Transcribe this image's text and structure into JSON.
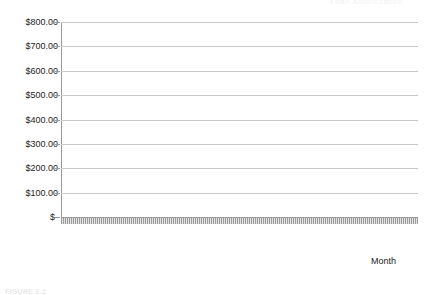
{
  "figure": {
    "cropped_title_fragment": "Loan Amortization",
    "cropped_caption_fragment": "FIGURE 2.2"
  },
  "axes": {
    "x_axis_label": "Month",
    "y_tick_labels": [
      "$800.00",
      "$700.00",
      "$600.00",
      "$500.00",
      "$400.00",
      "$300.00",
      "$200.00",
      "$100.00",
      "$-"
    ],
    "x_tick_labels": [
      "1",
      "16",
      "31",
      "46",
      "61",
      "76",
      "91",
      "106",
      "121",
      "136",
      "151",
      "166",
      "181",
      "196",
      "211",
      "226",
      "241",
      "256",
      "271",
      "286",
      "301",
      "316",
      "331",
      "346"
    ]
  },
  "legend": {
    "items": [
      {
        "label": "Payment",
        "color": "#808080"
      },
      {
        "label": "Interest",
        "color": "#555555"
      },
      {
        "label": "Principal",
        "color": "#aaaaaa"
      }
    ]
  },
  "chart_data": {
    "type": "line",
    "title": "Loan Amortization",
    "xlabel": "Month",
    "ylabel": "",
    "xlim": [
      1,
      360
    ],
    "ylim": [
      0,
      800
    ],
    "grid": true,
    "legend_position": "bottom",
    "ytick_values": [
      800,
      700,
      600,
      500,
      400,
      300,
      200,
      100,
      0
    ],
    "ytick_labels": [
      "$800.00",
      "$700.00",
      "$600.00",
      "$500.00",
      "$400.00",
      "$300.00",
      "$200.00",
      "$100.00",
      "$-"
    ],
    "xtick_values": [
      1,
      16,
      31,
      46,
      61,
      76,
      91,
      106,
      121,
      136,
      151,
      166,
      181,
      196,
      211,
      226,
      241,
      256,
      271,
      286,
      301,
      316,
      331,
      346
    ],
    "x": [
      1,
      16,
      31,
      46,
      61,
      76,
      91,
      106,
      121,
      136,
      151,
      166,
      181,
      196,
      211,
      226,
      241,
      256,
      271,
      286,
      301,
      316,
      331,
      346,
      360
    ],
    "series": [
      {
        "name": "Payment",
        "color": "#808080",
        "values": [
          742,
          742,
          742,
          742,
          742,
          742,
          742,
          742,
          742,
          742,
          742,
          742,
          742,
          742,
          742,
          742,
          742,
          742,
          742,
          742,
          742,
          742,
          742,
          742,
          742
        ]
      },
      {
        "name": "Interest",
        "color": "#555555",
        "values": [
          679,
          672,
          665,
          657,
          648,
          639,
          629,
          618,
          606,
          594,
          580,
          565,
          549,
          532,
          513,
          493,
          471,
          447,
          421,
          393,
          363,
          330,
          294,
          255,
          0
        ]
      },
      {
        "name": "Principal",
        "color": "#aaaaaa",
        "values": [
          63,
          70,
          77,
          85,
          94,
          103,
          113,
          124,
          136,
          148,
          162,
          177,
          193,
          210,
          229,
          249,
          271,
          295,
          321,
          349,
          379,
          412,
          448,
          487,
          740
        ]
      }
    ]
  }
}
